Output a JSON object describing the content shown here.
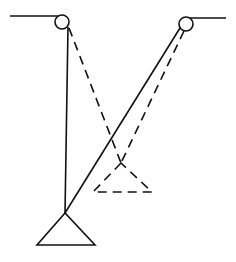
{
  "diagram": {
    "colors": {
      "line": "#111111",
      "background": "#ffffff"
    },
    "left_pulley": {
      "cx": 62,
      "cy": 22,
      "r": 7,
      "support_line": {
        "x1": 10,
        "y1": 16,
        "x2": 58,
        "y2": 16
      }
    },
    "right_pulley": {
      "cx": 186,
      "cy": 24,
      "r": 7,
      "support_line": {
        "x1": 190,
        "y1": 18,
        "x2": 226,
        "y2": 18
      }
    },
    "solid_weight": {
      "apex": [
        65,
        213
      ],
      "base_left": [
        37,
        245
      ],
      "base_right": [
        95,
        245
      ],
      "rope_left": {
        "from": [
          68,
          27
        ],
        "to": [
          65,
          213
        ]
      },
      "rope_right": {
        "from": [
          180,
          28
        ],
        "to": [
          65,
          213
        ]
      }
    },
    "dashed_weight": {
      "apex": [
        121,
        163
      ],
      "base_left": [
        93,
        192
      ],
      "base_right": [
        152,
        192
      ],
      "rope_left": {
        "from": [
          69,
          28
        ],
        "to": [
          121,
          163
        ]
      },
      "rope_right": {
        "from": [
          184,
          31
        ],
        "to": [
          121,
          163
        ]
      }
    }
  }
}
